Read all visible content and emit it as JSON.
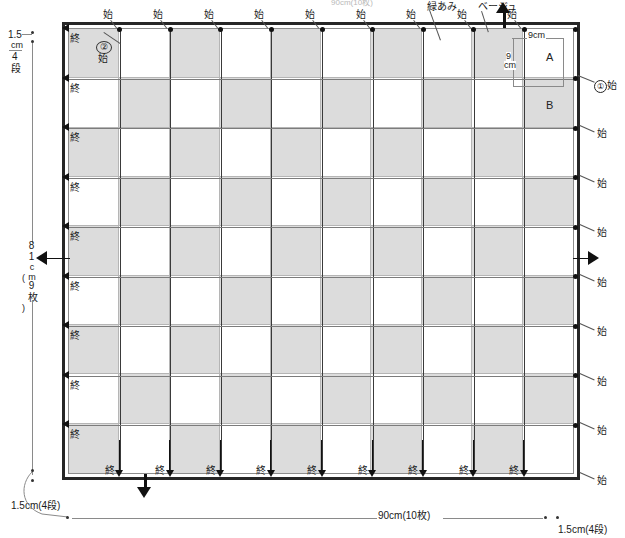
{
  "diagram": {
    "title_partial": "90cm(10枚)",
    "colors": {
      "shaded": "#dcdcdc",
      "plain": "#ffffff",
      "frame": "#262626",
      "line": "#7c7c7c"
    },
    "grid": {
      "columns": 10,
      "rows": 9,
      "pattern": "checkerboard",
      "first_cell_shaded": true
    }
  },
  "legend": {
    "shaded_label": "緑あみ",
    "plain_label": "ベージュ"
  },
  "cells": {
    "a_label": "A",
    "b_label": "B",
    "a_width": "9cm",
    "a_height_line1": "9",
    "a_height_line2": "cm"
  },
  "markers": {
    "start": "始",
    "end": "終",
    "start_one": "始",
    "start_one_num": "①",
    "start_two": "始",
    "start_two_num": "②"
  },
  "top_labels": [
    "始",
    "始",
    "始",
    "始",
    "始",
    "始",
    "始",
    "始",
    "始"
  ],
  "bottom_labels": [
    "終",
    "終",
    "終",
    "終",
    "終",
    "終",
    "終",
    "終",
    "終"
  ],
  "left_labels": [
    "終",
    "終",
    "終",
    "終",
    "終",
    "終",
    "終",
    "終",
    "終"
  ],
  "right_labels": [
    "始",
    "始",
    "始",
    "始",
    "始",
    "始",
    "始",
    "始"
  ],
  "dimensions": {
    "top_left_value": "1.5",
    "top_left_unit": "cm",
    "top_left_rows": "4",
    "top_left_rows_unit": "段",
    "left_height_value": "81",
    "left_height_unit": "cm",
    "left_height_count": "9",
    "left_height_count_unit": "枚",
    "bottom_left": "1.5cm(4段)",
    "bottom_width": "90cm(10枚)",
    "bottom_right": "1.5cm(4段)"
  }
}
